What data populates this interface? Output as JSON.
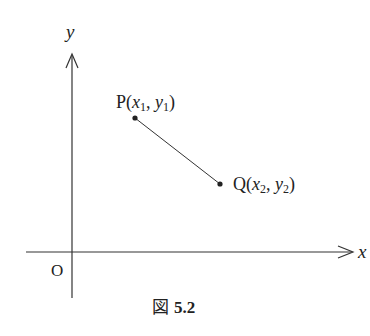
{
  "figure": {
    "caption_prefix": "図",
    "caption_number": "5.2",
    "axes": {
      "x_label": "x",
      "y_label": "y",
      "origin_label": "O"
    },
    "points": [
      {
        "name": "P",
        "coord_open": "(",
        "x_var": "x",
        "x_sub": "1",
        "sep": ", ",
        "y_var": "y",
        "y_sub": "1",
        "coord_close": ")"
      },
      {
        "name": "Q",
        "coord_open": "(",
        "x_var": "x",
        "x_sub": "2",
        "sep": ", ",
        "y_var": "y",
        "y_sub": "2",
        "coord_close": ")"
      }
    ],
    "colors": {
      "ink": "#222222",
      "line": "#333333"
    }
  }
}
